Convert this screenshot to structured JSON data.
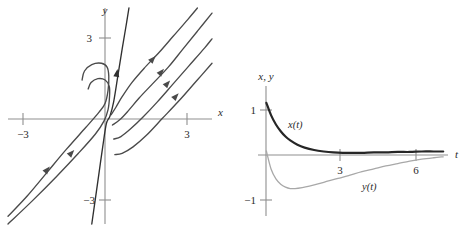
{
  "figure": {
    "background_color": "#ffffff",
    "ink_color": "#3a3a3a",
    "axis_color": "#8f8f8f",
    "dark_curve_color": "#262626",
    "light_curve_color": "#a8a8a8"
  },
  "panels": [
    {
      "id": "phase-portrait",
      "name": "phase-plane",
      "axes": {
        "x_axis_label": "x",
        "y_axis_label": "y",
        "x_ticks": [
          {
            "value": -3,
            "label": "−3"
          },
          {
            "value": 3,
            "label": "3"
          }
        ],
        "y_ticks": [
          {
            "value": 3,
            "label": "3"
          },
          {
            "value": -3,
            "label": "−3"
          }
        ],
        "xlim": [
          -4.2,
          4.2
        ],
        "ylim": [
          -4.2,
          4.2
        ],
        "grid": false
      }
    },
    {
      "id": "time-series",
      "name": "solution-curves",
      "axes": {
        "x_axis_label": "t",
        "y_axis_label": "x, y",
        "x_ticks": [
          {
            "value": 3,
            "label": "3"
          },
          {
            "value": 6,
            "label": "6"
          }
        ],
        "y_ticks": [
          {
            "value": 1,
            "label": "1"
          },
          {
            "value": -1,
            "label": "−1"
          }
        ],
        "xlim": [
          -0.35,
          7.6
        ],
        "ylim": [
          -1.35,
          1.35
        ],
        "grid": false
      },
      "curve_labels": [
        {
          "key": "x",
          "text": "x(t)"
        },
        {
          "key": "y",
          "text": "y(t)"
        }
      ]
    }
  ],
  "chart_data": [
    {
      "type": "line",
      "id": "phase-portrait",
      "title": "",
      "xlabel": "x",
      "ylabel": "y",
      "xlim": [
        -4.2,
        4.2
      ],
      "ylim": [
        -4.2,
        4.2
      ],
      "grid": false,
      "legend": "none",
      "description": "Phase plane of a degenerate (improper) node at the origin. Trajectories run nearly parallel to a line of slope about 1 far from the origin, then bend sharply into the steep eigendirection of slope about 6 near the origin. Arrows point away from the origin (up and to the right) indicating an unstable node.",
      "tick_labels": {
        "x": [
          "−3",
          "3"
        ],
        "y": [
          "3",
          "−3"
        ]
      },
      "series": [
        {
          "name": "trajectory-1-straight-far-left",
          "color": "#4a4a4a",
          "arrow_at": [
            -2.6,
            -2.1
          ],
          "arrow_direction": "up-right",
          "points": [
            [
              -4.2,
              -3.9
            ],
            [
              -3.4,
              -3.1
            ],
            [
              -2.6,
              -2.2
            ],
            [
              -1.8,
              -1.3
            ],
            [
              -1.0,
              -0.45
            ],
            [
              -0.45,
              0.15
            ],
            [
              -0.2,
              0.5
            ],
            [
              -0.08,
              1.0
            ],
            [
              -0.05,
              1.55
            ],
            [
              -0.12,
              1.9
            ],
            [
              -0.35,
              2.05
            ],
            [
              -0.75,
              2.0
            ],
            [
              -1.05,
              1.75
            ],
            [
              -1.15,
              1.4
            ]
          ]
        },
        {
          "name": "trajectory-2",
          "color": "#4a4a4a",
          "arrow_at": [
            -1.6,
            -1.45
          ],
          "arrow_direction": "up-right",
          "points": [
            [
              -4.2,
              -4.2
            ],
            [
              -3.2,
              -3.3
            ],
            [
              -2.2,
              -2.35
            ],
            [
              -1.3,
              -1.45
            ],
            [
              -0.6,
              -0.7
            ],
            [
              -0.25,
              -0.2
            ],
            [
              -0.08,
              0.25
            ],
            [
              -0.02,
              0.75
            ],
            [
              -0.03,
              1.15
            ],
            [
              -0.2,
              1.4
            ],
            [
              -0.5,
              1.45
            ],
            [
              -0.78,
              1.3
            ],
            [
              -0.9,
              1.05
            ]
          ]
        },
        {
          "name": "trajectory-3-steep-separatrix",
          "color": "#303030",
          "arrow_at": [
            0.28,
            1.65
          ],
          "arrow_direction": "up-right",
          "points": [
            [
              -0.75,
              -4.2
            ],
            [
              -0.6,
              -3.2
            ],
            [
              -0.45,
              -2.2
            ],
            [
              -0.3,
              -1.2
            ],
            [
              -0.15,
              -0.3
            ],
            [
              0.0,
              0.0
            ],
            [
              0.15,
              0.55
            ],
            [
              0.33,
              1.6
            ],
            [
              0.5,
              2.6
            ],
            [
              0.66,
              3.5
            ],
            [
              0.78,
              4.2
            ]
          ]
        },
        {
          "name": "trajectory-4-upper-right",
          "color": "#4a4a4a",
          "arrow_at": [
            1.75,
            2.2
          ],
          "arrow_direction": "up-right",
          "points": [
            [
              0.05,
              0.05
            ],
            [
              0.25,
              0.35
            ],
            [
              0.5,
              0.75
            ],
            [
              0.9,
              1.3
            ],
            [
              1.4,
              1.85
            ],
            [
              2.0,
              2.45
            ],
            [
              2.6,
              3.1
            ],
            [
              3.2,
              3.75
            ],
            [
              3.6,
              4.2
            ]
          ]
        },
        {
          "name": "trajectory-5",
          "color": "#4a4a4a",
          "arrow_at": [
            2.1,
            1.7
          ],
          "arrow_direction": "up-right",
          "points": [
            [
              0.1,
              -0.35
            ],
            [
              0.4,
              -0.15
            ],
            [
              0.75,
              0.2
            ],
            [
              1.2,
              0.7
            ],
            [
              1.75,
              1.25
            ],
            [
              2.4,
              1.9
            ],
            [
              3.0,
              2.6
            ],
            [
              3.6,
              3.3
            ],
            [
              4.2,
              4.0
            ]
          ]
        },
        {
          "name": "trajectory-6",
          "color": "#4a4a4a",
          "arrow_at": [
            2.35,
            1.25
          ],
          "arrow_direction": "up-right",
          "points": [
            [
              0.15,
              -0.9
            ],
            [
              0.45,
              -0.8
            ],
            [
              0.85,
              -0.5
            ],
            [
              1.35,
              -0.05
            ],
            [
              1.95,
              0.55
            ],
            [
              2.6,
              1.25
            ],
            [
              3.25,
              1.95
            ],
            [
              3.9,
              2.65
            ],
            [
              4.2,
              3.0
            ]
          ]
        },
        {
          "name": "trajectory-7",
          "color": "#4a4a4a",
          "arrow_at": [
            2.7,
            0.75
          ],
          "arrow_direction": "up-right",
          "points": [
            [
              0.2,
              -1.5
            ],
            [
              0.5,
              -1.45
            ],
            [
              0.95,
              -1.2
            ],
            [
              1.5,
              -0.75
            ],
            [
              2.15,
              -0.1
            ],
            [
              2.85,
              0.6
            ],
            [
              3.55,
              1.35
            ],
            [
              4.2,
              2.05
            ]
          ]
        }
      ]
    },
    {
      "type": "line",
      "id": "time-series",
      "title": "",
      "xlabel": "t",
      "ylabel": "x, y",
      "xlim": [
        -0.35,
        7.6
      ],
      "ylim": [
        -1.35,
        1.35
      ],
      "grid": false,
      "legend": "inline labels",
      "tick_labels": {
        "x": [
          "3",
          "6"
        ],
        "y": [
          "1",
          "−1"
        ]
      },
      "series": [
        {
          "name": "x(t)",
          "label": "x(t)",
          "color": "#262626",
          "width": 2.2,
          "x": [
            0,
            0.2,
            0.4,
            0.6,
            0.8,
            1.0,
            1.3,
            1.6,
            2.0,
            2.4,
            2.8,
            3.2,
            3.6,
            4.0,
            4.5,
            5.0,
            5.5,
            6.0,
            6.5,
            7.0,
            7.4
          ],
          "y": [
            1.0,
            0.74,
            0.55,
            0.41,
            0.3,
            0.22,
            0.13,
            0.07,
            0.02,
            -0.01,
            -0.03,
            -0.04,
            -0.04,
            -0.04,
            -0.03,
            -0.03,
            -0.02,
            -0.02,
            -0.01,
            -0.01,
            -0.01
          ]
        },
        {
          "name": "y(t)",
          "label": "y(t)",
          "color": "#a8a8a8",
          "width": 1.3,
          "x": [
            0,
            0.2,
            0.4,
            0.6,
            0.8,
            1.0,
            1.2,
            1.5,
            1.8,
            2.2,
            2.6,
            3.0,
            3.5,
            4.0,
            4.5,
            5.0,
            5.5,
            6.0,
            6.5,
            7.0,
            7.4
          ],
          "y": [
            0.0,
            -0.38,
            -0.58,
            -0.69,
            -0.75,
            -0.78,
            -0.78,
            -0.76,
            -0.73,
            -0.68,
            -0.62,
            -0.57,
            -0.5,
            -0.43,
            -0.37,
            -0.31,
            -0.26,
            -0.21,
            -0.17,
            -0.14,
            -0.12
          ]
        }
      ]
    }
  ]
}
